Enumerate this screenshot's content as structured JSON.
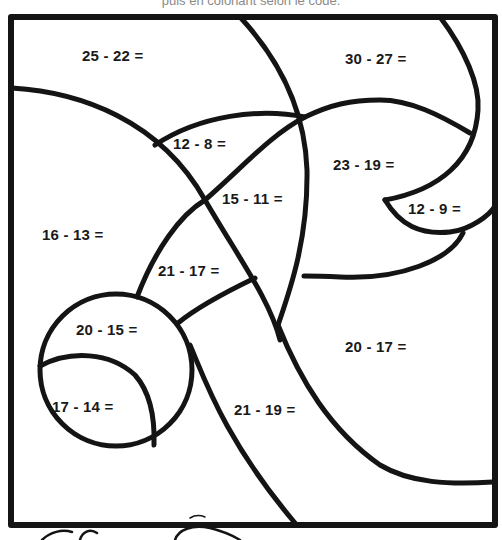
{
  "header": {
    "caption": "puis en coloriant selon le code."
  },
  "colors": {
    "line": "#141414",
    "background": "#ffffff",
    "caption": "#8a8a8a"
  },
  "regions": [
    {
      "id": "r1",
      "equation": "25 - 22 =",
      "x": 82,
      "y": 47
    },
    {
      "id": "r2",
      "equation": "30 - 27 =",
      "x": 345,
      "y": 50
    },
    {
      "id": "r3",
      "equation": "12 - 8 =",
      "x": 173,
      "y": 135
    },
    {
      "id": "r4",
      "equation": "23 - 19 =",
      "x": 333,
      "y": 156
    },
    {
      "id": "r5",
      "equation": "15 - 11 =",
      "x": 222,
      "y": 190
    },
    {
      "id": "r6",
      "equation": "12 - 9 =",
      "x": 408,
      "y": 200
    },
    {
      "id": "r7",
      "equation": "16 - 13 =",
      "x": 42,
      "y": 226
    },
    {
      "id": "r8",
      "equation": "21 - 17 =",
      "x": 158,
      "y": 262
    },
    {
      "id": "r9",
      "equation": "20 - 15 =",
      "x": 76,
      "y": 321
    },
    {
      "id": "r10",
      "equation": "20 - 17 =",
      "x": 345,
      "y": 338
    },
    {
      "id": "r11",
      "equation": "17 - 14 =",
      "x": 52,
      "y": 398
    },
    {
      "id": "r12",
      "equation": "21 - 19 =",
      "x": 234,
      "y": 401
    }
  ]
}
